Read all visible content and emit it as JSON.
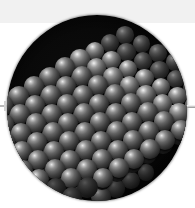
{
  "figure": {
    "kind": "scientific-illustration",
    "alt_text": "Close-up of a crystal lattice rendered as rows of shaded spheres inside a dark circular field, with a thin circular callout ring highlighting a cluster of atoms and a leader line running off to the right edge.",
    "background_color": "#ffffff",
    "top_band_color": "#f1f1f1",
    "field_color": "#000000",
    "callout_ring_color": "#d8d8d8",
    "leader_line_color": "#d2d2d2",
    "atom_highlight_color": "#eaeaea",
    "atom_shadow_color": "#121212"
  },
  "specimen_field": {
    "label": "specimen-circle",
    "center_x": 97,
    "center_y": 108,
    "radius": 90
  },
  "callout": {
    "label": "magnified-region",
    "center_x": 115,
    "center_y": 107,
    "radius": 29,
    "leader_line_y": 106,
    "leader_line_end_x": 195
  },
  "lattice": {
    "description": "face-centred cubic block of spheres",
    "front_face_rows": 7,
    "front_face_cols": 7,
    "top_face_rows": 4,
    "side_face_cols": 4,
    "sphere_diameter_px": 20,
    "faces": [
      "front",
      "top",
      "side"
    ]
  },
  "markers": {
    "left_tick": "scale-tick",
    "leader": "callout-leader"
  },
  "chart_data": null
}
